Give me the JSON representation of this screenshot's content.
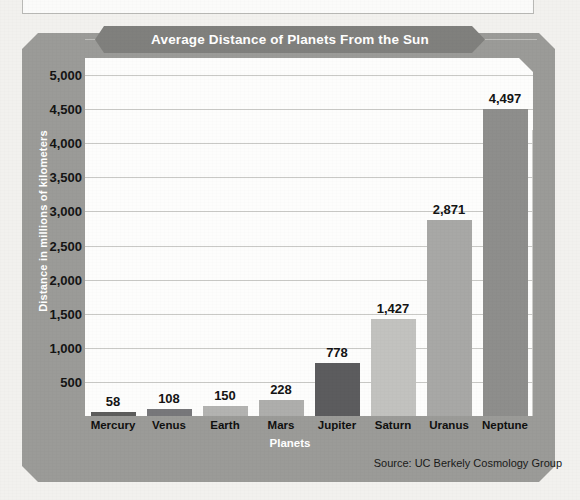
{
  "figure": {
    "title": "Average Distance of Planets From the Sun",
    "y_axis_title": "Distance in millions of kilometers",
    "x_axis_title": "Planets",
    "source_note": "Source: UC Berkely Cosmology Group"
  },
  "colors": {
    "frame": "#9b9b98",
    "panel": "#fdfdfc",
    "banner": "#80807d",
    "gridline": "#c9c9c6",
    "title_text": "#ffffff",
    "label_text": "#141414"
  },
  "chart_data": {
    "type": "bar",
    "title": "Average Distance of Planets From the Sun",
    "xlabel": "Planets",
    "ylabel": "Distance in millions of kilometers",
    "categories": [
      "Mercury",
      "Venus",
      "Earth",
      "Mars",
      "Jupiter",
      "Saturn",
      "Uranus",
      "Neptune"
    ],
    "values": [
      58,
      108,
      150,
      228,
      778,
      1427,
      2871,
      4497
    ],
    "value_labels": [
      "58",
      "108",
      "150",
      "228",
      "778",
      "1,427",
      "2,871",
      "4,497"
    ],
    "bar_colors": [
      "#5d5d5c",
      "#77777a",
      "#b3b3b1",
      "#aeaeac",
      "#5c5c5e",
      "#c2c2bf",
      "#a8a8a6",
      "#8e8e8c"
    ],
    "ylim": [
      0,
      5250
    ],
    "ytick_values": [
      500,
      1000,
      1500,
      2000,
      2500,
      3000,
      3500,
      4000,
      4500,
      5000
    ],
    "ytick_labels": [
      "500",
      "1,000",
      "1,500",
      "2,000",
      "2,500",
      "3,000",
      "3,500",
      "4,000",
      "4,500",
      "5,000"
    ],
    "grid": true,
    "grid_axis": "y",
    "legend": false,
    "source": "Source: UC Berkely Cosmology Group"
  }
}
